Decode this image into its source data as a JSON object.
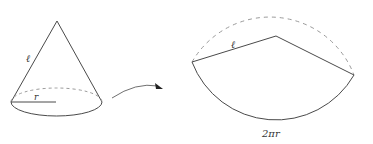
{
  "diagram": {
    "colors": {
      "stroke": "#4a4a4a",
      "dashed": "#9a9a9a",
      "text": "#333333",
      "background": "#ffffff"
    },
    "cone": {
      "slant_label": "ℓ",
      "radius_label": "r"
    },
    "arrow": {
      "direction": "cone-to-sector"
    },
    "sector": {
      "radius_label": "ℓ",
      "arc_label": "2πr"
    }
  }
}
